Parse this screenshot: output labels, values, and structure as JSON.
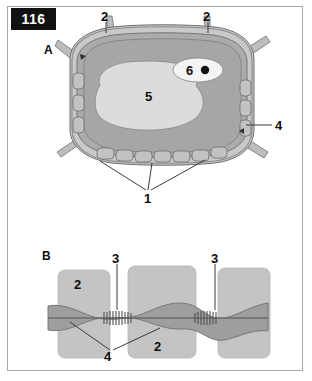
{
  "figure": {
    "plate_number": "116",
    "background_color": "#ffffff",
    "frame_border_color": "#a8a8a8"
  },
  "panels": [
    {
      "id": "A",
      "label": "A",
      "caption_x": 46,
      "caption_y": 44
    },
    {
      "id": "B",
      "label": "B",
      "caption_x": 42,
      "caption_y": 250
    }
  ],
  "panel_a": {
    "label": "A",
    "colors": {
      "wall_outer": "#bdbdbd",
      "wall_mid": "#9a9a9a",
      "wall_stroke": "#6e6e6e",
      "cytoplasm": "#a6a6a6",
      "vacuole": "#d9d9d9",
      "nucleus": "#f2f2f2",
      "nucleolus": "#111111",
      "leader": "#3a3a3a"
    },
    "callouts": [
      {
        "number": "2",
        "x": 103,
        "y": 16,
        "target": "cell-wall-top-left"
      },
      {
        "number": "2",
        "x": 205,
        "y": 16,
        "target": "cell-wall-top-right"
      },
      {
        "number": "6",
        "x": 190,
        "y": 65,
        "target": "nucleus"
      },
      {
        "number": "5",
        "x": 148,
        "y": 95,
        "target": "vacuole"
      },
      {
        "number": "4",
        "x": 277,
        "y": 121,
        "target": "middle-lamella"
      },
      {
        "number": "1",
        "x": 144,
        "y": 197,
        "target": "plasmodesmata-group"
      }
    ]
  },
  "panel_b": {
    "label": "B",
    "colors": {
      "cell_block": "#c4c4c4",
      "block_stroke": "#b0b0b0",
      "cytoplasm_band": "#9e9e9e",
      "band_stroke": "#707070",
      "channel_stripes": "#5a5a5a",
      "desmotubule": "#6b6b6b",
      "leader": "#3a3a3a"
    },
    "callouts": [
      {
        "number": "3",
        "x": 113,
        "y": 256,
        "target": "plasmodesma-left"
      },
      {
        "number": "3",
        "x": 212,
        "y": 256,
        "target": "plasmodesma-right"
      },
      {
        "number": "2",
        "x": 76,
        "y": 282,
        "target": "cell-block-upper-left"
      },
      {
        "number": "2",
        "x": 155,
        "y": 352,
        "target": "cell-block-center"
      },
      {
        "number": "4",
        "x": 104,
        "y": 355,
        "target": "plasma-membrane"
      }
    ]
  },
  "legend_numbers": {
    "1": "plasmodesmata row",
    "2": "cell wall / cell",
    "3": "plasmodesma",
    "4": "plasma membrane / middle lamella",
    "5": "vacuole",
    "6": "nucleus"
  }
}
